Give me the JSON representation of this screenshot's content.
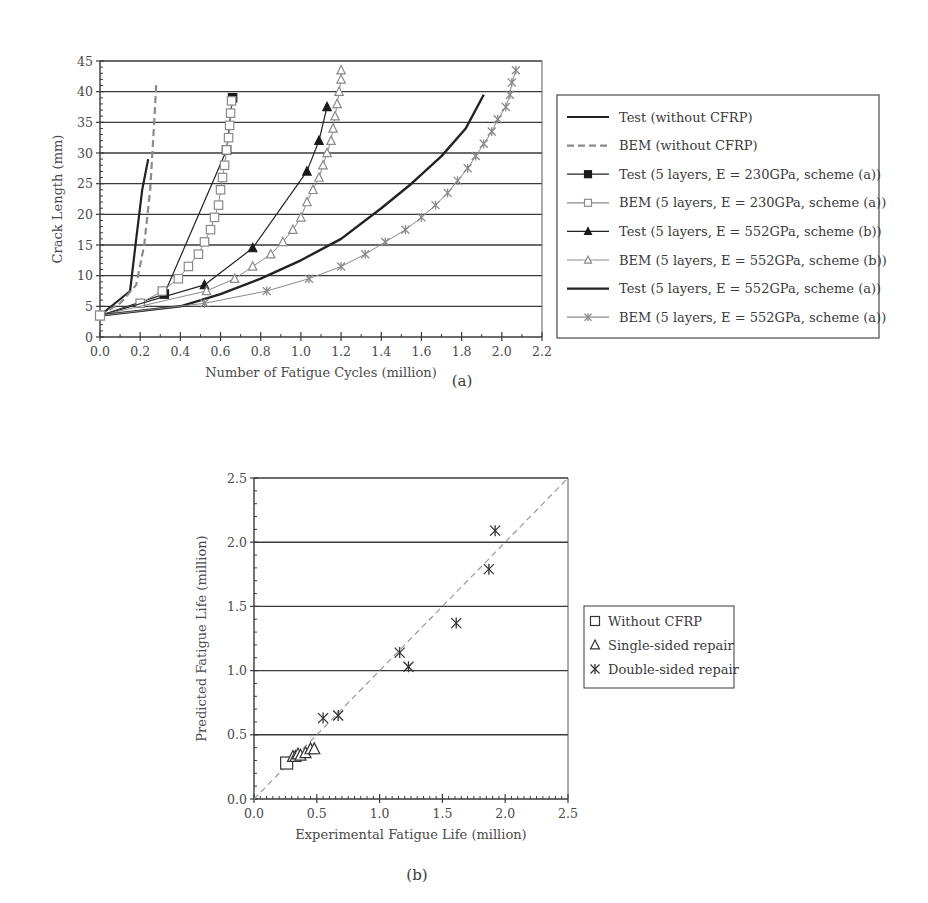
{
  "chart_data": [
    {
      "id": "a",
      "type": "line",
      "caption": "(a)",
      "xlabel": "Number of Fatigue Cycles (million)",
      "ylabel": "Crack Length (mm)",
      "xlim": [
        0,
        2.2
      ],
      "ylim": [
        0,
        45
      ],
      "xticks": [
        0.0,
        0.2,
        0.4,
        0.6,
        0.8,
        1.0,
        1.2,
        1.4,
        1.6,
        1.8,
        2.0,
        2.2
      ],
      "yticks": [
        0,
        5,
        10,
        15,
        20,
        25,
        30,
        35,
        40,
        45
      ],
      "grid": "horizontal",
      "legend_position": "right",
      "series": [
        {
          "name": "Test (without CFRP)",
          "style": "solid",
          "color": "#222222",
          "width": 2.2,
          "marker": "none",
          "x": [
            0,
            0.15,
            0.18,
            0.21,
            0.24
          ],
          "y": [
            3.5,
            7.5,
            16,
            24,
            29
          ]
        },
        {
          "name": "BEM (without CFRP)",
          "style": "dashed",
          "color": "#8a8a8a",
          "width": 2.2,
          "marker": "none",
          "x": [
            0,
            0.1,
            0.18,
            0.22,
            0.25,
            0.27,
            0.28
          ],
          "y": [
            3.5,
            5.5,
            8.5,
            15,
            24,
            35,
            41.5
          ]
        },
        {
          "name": "Test (5 layers, E = 230GPa, scheme (a))",
          "style": "solid",
          "color": "#222222",
          "width": 1.2,
          "marker": "filled-square",
          "x": [
            0,
            0.32,
            0.63,
            0.66
          ],
          "y": [
            3.5,
            7,
            30.5,
            39
          ]
        },
        {
          "name": "BEM (5 layers, E = 230GPa, scheme (a))",
          "style": "solid",
          "color": "#8a8a8a",
          "width": 1.0,
          "marker": "open-square",
          "x": [
            0,
            0.2,
            0.31,
            0.39,
            0.44,
            0.49,
            0.52,
            0.55,
            0.57,
            0.59,
            0.6,
            0.61,
            0.62,
            0.63,
            0.64,
            0.645,
            0.65,
            0.655
          ],
          "y": [
            3.5,
            5.5,
            7.5,
            9.5,
            11.5,
            13.5,
            15.5,
            17.5,
            19.5,
            21.5,
            24,
            26,
            28,
            30.5,
            32.5,
            34.5,
            36.5,
            38.5
          ]
        },
        {
          "name": "Test (5 layers, E = 552GPa, scheme (b))",
          "style": "solid",
          "color": "#222222",
          "width": 1.2,
          "marker": "filled-triangle",
          "x": [
            0,
            0.52,
            0.76,
            1.03,
            1.09,
            1.13
          ],
          "y": [
            3.5,
            8.5,
            14.5,
            27,
            32,
            37.5
          ]
        },
        {
          "name": "BEM (5 layers, E = 552GPa, scheme (b))",
          "style": "solid",
          "color": "#8a8a8a",
          "width": 1.0,
          "marker": "open-triangle",
          "x": [
            0,
            0.53,
            0.67,
            0.76,
            0.85,
            0.91,
            0.96,
            1.0,
            1.03,
            1.06,
            1.09,
            1.11,
            1.13,
            1.15,
            1.16,
            1.17,
            1.18,
            1.19,
            1.2,
            1.2
          ],
          "y": [
            3.5,
            7.5,
            9.5,
            11.5,
            13.5,
            15.5,
            17.5,
            19.5,
            22,
            24,
            26,
            28,
            30,
            32,
            34,
            36,
            38,
            40,
            42,
            43.5
          ]
        },
        {
          "name": "Test (5 layers, E = 552GPa, scheme (a))",
          "style": "solid",
          "color": "#222222",
          "width": 2.4,
          "marker": "none",
          "x": [
            0,
            0.4,
            0.6,
            0.8,
            1.0,
            1.2,
            1.4,
            1.55,
            1.7,
            1.82,
            1.91
          ],
          "y": [
            3.5,
            5,
            7,
            9.5,
            12.5,
            16,
            21,
            25,
            29.5,
            34,
            39.5
          ]
        },
        {
          "name": "BEM (5 layers, E = 552GPa, scheme (a))",
          "style": "solid",
          "color": "#8a8a8a",
          "width": 1.0,
          "marker": "star",
          "x": [
            0,
            0.52,
            0.83,
            1.04,
            1.2,
            1.32,
            1.42,
            1.52,
            1.6,
            1.67,
            1.73,
            1.78,
            1.83,
            1.87,
            1.91,
            1.95,
            1.98,
            2.02,
            2.04,
            2.05,
            2.07
          ],
          "y": [
            3.5,
            5.5,
            7.5,
            9.5,
            11.5,
            13.5,
            15.5,
            17.5,
            19.5,
            21.5,
            23.5,
            25.5,
            27.5,
            29.5,
            31.5,
            33.5,
            35.5,
            37.5,
            39.5,
            41.5,
            43.5
          ]
        }
      ]
    },
    {
      "id": "b",
      "type": "scatter",
      "caption": "(b)",
      "xlabel": "Experimental Fatigue Life (million)",
      "ylabel": "Predicted Fatigue Life (million)",
      "xlim": [
        0,
        2.5
      ],
      "ylim": [
        0,
        2.5
      ],
      "xticks": [
        0.0,
        0.5,
        1.0,
        1.5,
        2.0,
        2.5
      ],
      "yticks": [
        0.0,
        0.5,
        1.0,
        1.5,
        2.0,
        2.5
      ],
      "grid": "horizontal",
      "legend_position": "right",
      "reference_line": {
        "type": "y=x",
        "style": "dashed",
        "color": "#9a9a9a"
      },
      "series": [
        {
          "name": "Without CFRP",
          "marker": "open-square",
          "x": [
            0.26
          ],
          "y": [
            0.28
          ]
        },
        {
          "name": "Single-sided repair",
          "marker": "open-triangle",
          "x": [
            0.31,
            0.33,
            0.35,
            0.37,
            0.41,
            0.45,
            0.48
          ],
          "y": [
            0.33,
            0.33,
            0.35,
            0.34,
            0.36,
            0.39,
            0.39
          ]
        },
        {
          "name": "Double-sided repair",
          "marker": "star",
          "x": [
            0.55,
            0.67,
            1.16,
            1.23,
            1.61,
            1.87,
            1.92
          ],
          "y": [
            0.63,
            0.65,
            1.14,
            1.03,
            1.37,
            1.79,
            2.09
          ]
        }
      ]
    }
  ]
}
